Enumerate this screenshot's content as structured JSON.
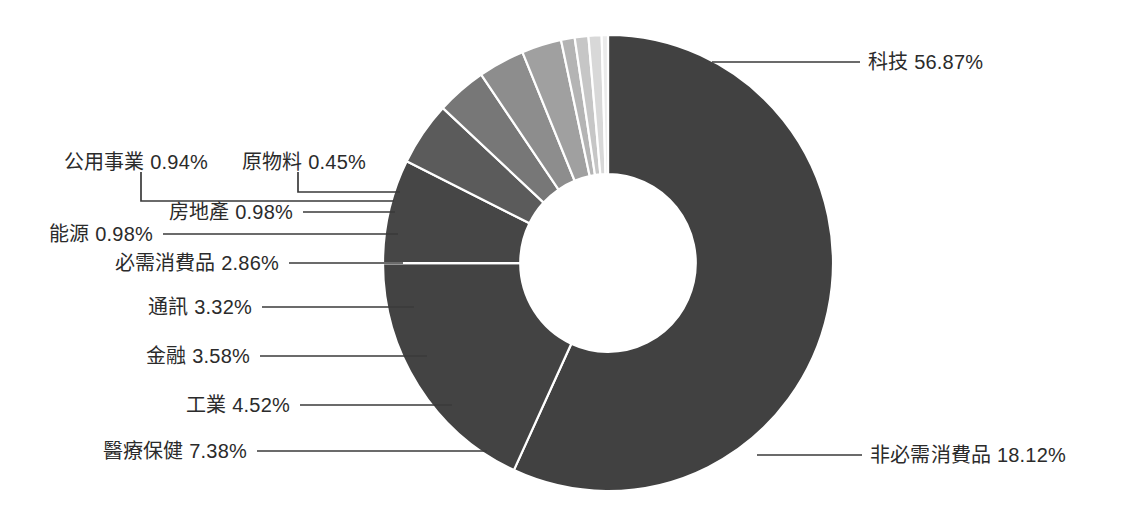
{
  "chart_data": {
    "type": "pie",
    "variant": "donut",
    "title": "",
    "subtitle": "",
    "xlabel": "",
    "ylabel": "",
    "legend_position": "none",
    "grid": false,
    "value_unit": "%",
    "total": 100.0,
    "categories": [
      "科技",
      "非必需消費品",
      "醫療保健",
      "工業",
      "金融",
      "通訊",
      "必需消費品",
      "能源",
      "房地產",
      "公用事業",
      "原物料"
    ],
    "values": [
      56.87,
      18.12,
      7.38,
      4.52,
      3.58,
      3.32,
      2.86,
      0.98,
      0.98,
      0.94,
      0.45
    ],
    "labels": [
      "科技 56.87%",
      "非必需消費品 18.12%",
      "醫療保健 7.38%",
      "工業 4.52%",
      "金融 3.58%",
      "通訊 3.32%",
      "必需消費品 2.86%",
      "能源 0.98%",
      "房地產 0.98%",
      "公用事業 0.94%",
      "原物料 0.45%"
    ],
    "colors": [
      "#414141",
      "#434343",
      "#464646",
      "#5b5b5b",
      "#777777",
      "#8d8d8d",
      "#a0a0a0",
      "#b4b4b4",
      "#c6c6c6",
      "#d8d8d8",
      "#ebebeb"
    ],
    "slice_stroke": "#ffffff",
    "leader_color": "#3a3a3a",
    "label_color": "#2b2b2b",
    "background": "#ffffff",
    "start_angle_deg": -90,
    "direction": "clockwise",
    "inner_radius_ratio": 0.39
  },
  "slices": [
    {
      "name": "科技",
      "value": 56.87,
      "label": "科技 56.87%",
      "color": "#414141"
    },
    {
      "name": "非必需消費品",
      "value": 18.12,
      "label": "非必需消費品 18.12%",
      "color": "#434343"
    },
    {
      "name": "醫療保健",
      "value": 7.38,
      "label": "醫療保健 7.38%",
      "color": "#464646"
    },
    {
      "name": "工業",
      "value": 4.52,
      "label": "工業 4.52%",
      "color": "#5b5b5b"
    },
    {
      "name": "金融",
      "value": 3.58,
      "label": "金融 3.58%",
      "color": "#777777"
    },
    {
      "name": "通訊",
      "value": 3.32,
      "label": "通訊 3.32%",
      "color": "#8d8d8d"
    },
    {
      "name": "必需消費品",
      "value": 2.86,
      "label": "必需消費品 2.86%",
      "color": "#a0a0a0"
    },
    {
      "name": "能源",
      "value": 0.98,
      "label": "能源 0.98%",
      "color": "#b4b4b4"
    },
    {
      "name": "房地產",
      "value": 0.98,
      "label": "房地產 0.98%",
      "color": "#c6c6c6"
    },
    {
      "name": "公用事業",
      "value": 0.94,
      "label": "公用事業 0.94%",
      "color": "#d8d8d8"
    },
    {
      "name": "原物料",
      "value": 0.45,
      "label": "原物料 0.45%",
      "color": "#ebebeb"
    }
  ],
  "callouts": {
    "technology": "科技 56.87%",
    "cons_discretionary": "非必需消費品 18.12%",
    "healthcare": "醫療保健 7.38%",
    "industrials": "工業 4.52%",
    "financials": "金融 3.58%",
    "communication": "通訊 3.32%",
    "cons_staples": "必需消費品 2.86%",
    "energy": "能源 0.98%",
    "real_estate": "房地產 0.98%",
    "utilities": "公用事業 0.94%",
    "materials": "原物料 0.45%"
  }
}
